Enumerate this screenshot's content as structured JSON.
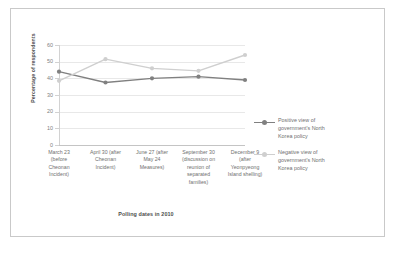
{
  "chart_data": {
    "type": "line",
    "title": "",
    "xlabel": "Polling dates in 2010",
    "ylabel": "Percentage of respondents",
    "categories": [
      "March 23 (before Cheonan Incident)",
      "April 30 (after Cheonan Incident)",
      "June 27 (after May 24 Measures)",
      "September 30 (discussion on reunion of separated families)",
      "December 9 (after Yeonpyeong Island shelling)"
    ],
    "category_lines": [
      [
        "March 23",
        "(before",
        "Cheonan",
        "Incident)"
      ],
      [
        "April 30 (after",
        "Cheonan",
        "Incident)"
      ],
      [
        "June 27 (after",
        "May 24",
        "Measures)"
      ],
      [
        "September 30",
        "(discussion on",
        "reunion of",
        "separated",
        "families)"
      ],
      [
        "December 9",
        "(after",
        "Yeonpyeong",
        "Island shelling)"
      ]
    ],
    "series": [
      {
        "name": "Positive view of government's North Korea policy",
        "color": "#808080",
        "values": [
          44,
          37.5,
          40,
          41,
          39
        ]
      },
      {
        "name": "Negative  view of government's North Korea policy",
        "color": "#cfcfcf",
        "values": [
          38.5,
          51.5,
          46,
          44.5,
          54
        ]
      }
    ],
    "ylim": [
      0,
      60
    ],
    "yticks": [
      0,
      10,
      20,
      30,
      40,
      50,
      60
    ],
    "ytick_labels": [
      "0",
      "10",
      "20",
      "30",
      "40",
      "50",
      "60"
    ],
    "grid": true,
    "grid_axis": "y",
    "legend_position": "right"
  },
  "legend": {
    "entries": [
      {
        "lines": [
          "Positive view of",
          "government's North",
          "Korea policy"
        ],
        "color": "#808080"
      },
      {
        "lines": [
          "Negative  view of",
          "government's North",
          "Korea policy"
        ],
        "color": "#cfcfcf"
      }
    ]
  },
  "colors": {
    "positive": "#808080",
    "negative": "#cfcfcf",
    "grid": "#e8e8e8",
    "axis": "#c4c4c4",
    "text": "#707070",
    "frame": "#c9c9c9",
    "background": "#ffffff"
  }
}
